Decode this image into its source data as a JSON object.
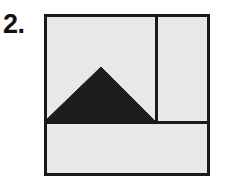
{
  "page": {
    "background_color": "#ffffff",
    "width": 228,
    "height": 196
  },
  "item": {
    "number_label": "2."
  },
  "figure": {
    "name": "square-divided-with-shaded-triangle",
    "colors": {
      "outline": "#1a1a1a",
      "region_fill": "#e8e8e8",
      "shaded_fill": "#1c1c1c",
      "background": "#ffffff"
    },
    "stroke_width_outer": 3,
    "stroke_width_inner": 3,
    "square": {
      "x": 2,
      "y": 2,
      "width": 166,
      "height": 162
    },
    "vertical_divider": {
      "x": 114,
      "y_top": 2,
      "y_bottom": 110
    },
    "horizontal_divider": {
      "y": 110,
      "x_left": 2,
      "x_right": 168
    },
    "triangle": {
      "apex": {
        "x": 59,
        "y": 55
      },
      "base_left": {
        "x": 2,
        "y": 110
      },
      "base_right": {
        "x": 114,
        "y": 110
      },
      "points": "59,55 2,110 114,110"
    },
    "regions": [
      {
        "name": "upper-left-region",
        "fill": "#e8e8e8"
      },
      {
        "name": "upper-right-region",
        "fill": "#e8e8e8"
      },
      {
        "name": "lower-region",
        "fill": "#e8e8e8"
      },
      {
        "name": "shaded-triangle-region",
        "fill": "#1c1c1c"
      }
    ]
  }
}
